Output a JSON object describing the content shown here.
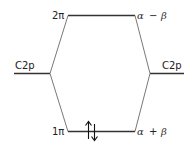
{
  "diagram": {
    "type": "molecular-orbital-energy-diagram",
    "left_atomic_orbital": {
      "label": "C2p"
    },
    "right_atomic_orbital": {
      "label": "C2p"
    },
    "molecular_orbitals": [
      {
        "name": "2π",
        "energy": "α − β",
        "occupancy": 0
      },
      {
        "name": "1π",
        "energy": "α + β",
        "occupancy": 2
      }
    ],
    "labels": {
      "top_mo": "2π",
      "top_energy_alpha": "α",
      "top_energy_op": "−",
      "top_energy_beta": "β",
      "bottom_mo": "1π",
      "bottom_energy_alpha": "α",
      "bottom_energy_op": "+",
      "bottom_energy_beta": "β",
      "left_ao": "C2p",
      "right_ao": "C2p"
    },
    "colors": {
      "line": "#333333",
      "connector": "#555555"
    }
  }
}
